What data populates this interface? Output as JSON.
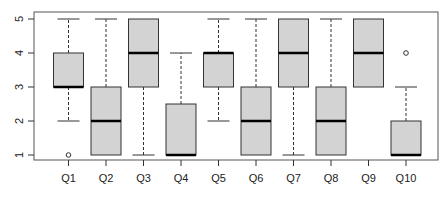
{
  "chart_data": {
    "type": "box",
    "title": "",
    "xlabel": "",
    "ylabel": "",
    "ylim": [
      1,
      5
    ],
    "yticks": [
      "1",
      "2",
      "3",
      "4",
      "5"
    ],
    "grid": false,
    "legend": null,
    "categories": [
      "Q1",
      "Q2",
      "Q3",
      "Q4",
      "Q5",
      "Q6",
      "Q7",
      "Q8",
      "Q9",
      "Q10"
    ],
    "boxes": [
      {
        "label": "Q1",
        "whisker_low": 2,
        "q1": 3,
        "median": 3,
        "q3": 4,
        "whisker_high": 5,
        "outliers": [
          1
        ]
      },
      {
        "label": "Q2",
        "whisker_low": 1,
        "q1": 1,
        "median": 2,
        "q3": 3,
        "whisker_high": 5,
        "outliers": []
      },
      {
        "label": "Q3",
        "whisker_low": 1,
        "q1": 3,
        "median": 4,
        "q3": 5,
        "whisker_high": 5,
        "outliers": []
      },
      {
        "label": "Q4",
        "whisker_low": 1,
        "q1": 1,
        "median": 1,
        "q3": 2.5,
        "whisker_high": 4,
        "outliers": []
      },
      {
        "label": "Q5",
        "whisker_low": 2,
        "q1": 3,
        "median": 4,
        "q3": 4,
        "whisker_high": 5,
        "outliers": []
      },
      {
        "label": "Q6",
        "whisker_low": 1,
        "q1": 1,
        "median": 2,
        "q3": 3,
        "whisker_high": 5,
        "outliers": []
      },
      {
        "label": "Q7",
        "whisker_low": 1,
        "q1": 3,
        "median": 4,
        "q3": 5,
        "whisker_high": 5,
        "outliers": []
      },
      {
        "label": "Q8",
        "whisker_low": 1,
        "q1": 1,
        "median": 2,
        "q3": 3,
        "whisker_high": 5,
        "outliers": []
      },
      {
        "label": "Q9",
        "whisker_low": 3,
        "q1": 3,
        "median": 4,
        "q3": 5,
        "whisker_high": 5,
        "outliers": []
      },
      {
        "label": "Q10",
        "whisker_low": 1,
        "q1": 1,
        "median": 1,
        "q3": 2,
        "whisker_high": 3,
        "outliers": [
          4
        ]
      }
    ],
    "colors": {
      "box_fill": "#d3d3d3",
      "box_stroke": "#333333",
      "median": "#000000",
      "axis": "#333333"
    }
  }
}
